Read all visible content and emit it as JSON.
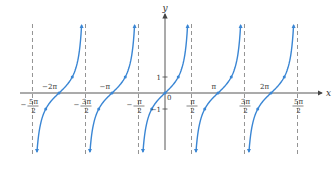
{
  "chart_data": {
    "type": "line",
    "title": "",
    "function": "y = tan x",
    "xlabel": "x",
    "ylabel": "y",
    "colors": {
      "curve": "#3a86d4",
      "axis": "#444444",
      "asymptote": "#888888",
      "text": "#333333"
    },
    "asymptotes": [
      "-5π/2",
      "-3π/2",
      "-π/2",
      "π/2",
      "3π/2",
      "5π/2"
    ],
    "asymptote_values": [
      -7.854,
      -4.712,
      -1.571,
      1.571,
      4.712,
      7.854
    ],
    "x_tick_labels_below": [
      {
        "num": "5π",
        "den": "2",
        "sign": "−",
        "value": -7.854
      },
      {
        "num": "3π",
        "den": "2",
        "sign": "−",
        "value": -4.712
      },
      {
        "num": "π",
        "den": "2",
        "sign": "−",
        "value": -1.571
      },
      {
        "num": "π",
        "den": "2",
        "sign": "",
        "value": 1.571
      },
      {
        "num": "3π",
        "den": "2",
        "sign": "",
        "value": 4.712
      },
      {
        "num": "5π",
        "den": "2",
        "sign": "",
        "value": 7.854
      }
    ],
    "x_tick_labels_above": [
      {
        "label": "−2π",
        "value": -6.283
      },
      {
        "label": "−π",
        "value": -3.142
      },
      {
        "label": "π",
        "value": 3.142
      },
      {
        "label": "2π",
        "value": 6.283
      }
    ],
    "origin_label": "0",
    "y_ticks": [
      {
        "label": "1",
        "value": 1
      },
      {
        "label": "−1",
        "value": -1
      }
    ],
    "branches_centers": [
      -6.283,
      -3.142,
      0,
      3.142,
      6.283
    ],
    "marked_points_per_branch": [
      {
        "x_offset": "-π/4",
        "y": -1
      },
      {
        "x_offset": "0",
        "y": 0
      },
      {
        "x_offset": "π/4",
        "y": 1
      }
    ],
    "legend": [],
    "grid": false
  }
}
